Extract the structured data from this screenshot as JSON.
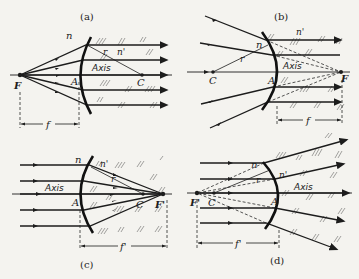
{
  "figure": {
    "panels": [
      {
        "id": "a",
        "caption": "(a)",
        "n": "n",
        "n_prime": "n'",
        "r": "r",
        "axis": "Axis",
        "A": "A",
        "C": "C",
        "focus": "F",
        "dim": "f"
      },
      {
        "id": "b",
        "caption": "(b)",
        "n": "n",
        "n_prime": "n'",
        "r": "r",
        "axis": "Axis",
        "A": "A",
        "C": "C",
        "focus": "F",
        "dim": "f"
      },
      {
        "id": "c",
        "caption": "(c)",
        "n": "n",
        "n_prime": "n'",
        "r": "r",
        "axis": "Axis",
        "A": "A",
        "C": "C",
        "focus": "F'",
        "dim": "f'"
      },
      {
        "id": "d",
        "caption": "(d)",
        "n": "n",
        "n_prime": "n'",
        "r": "r",
        "axis": "Axis",
        "A": "A",
        "C": "C",
        "focus": "F'",
        "dim": "f'"
      }
    ]
  },
  "colors": {
    "ink": "#1c1c1c",
    "paper": "#f4f3ef"
  }
}
